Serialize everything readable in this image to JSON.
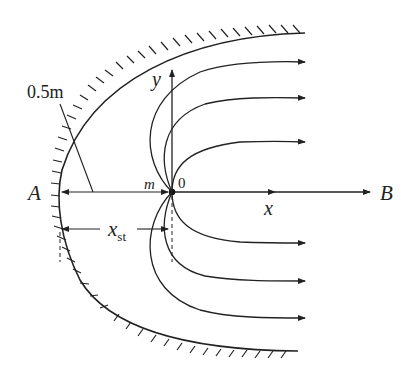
{
  "diagram": {
    "labels": {
      "A": "A",
      "B": "B",
      "x_axis": "x",
      "y_axis": "y",
      "origin": "0",
      "source_strength": "m",
      "wall_width": "0.5m",
      "stagnation_distance_main": "x",
      "stagnation_distance_sub": "st"
    },
    "colors": {
      "line": "#222222",
      "background": "#ffffff"
    }
  }
}
